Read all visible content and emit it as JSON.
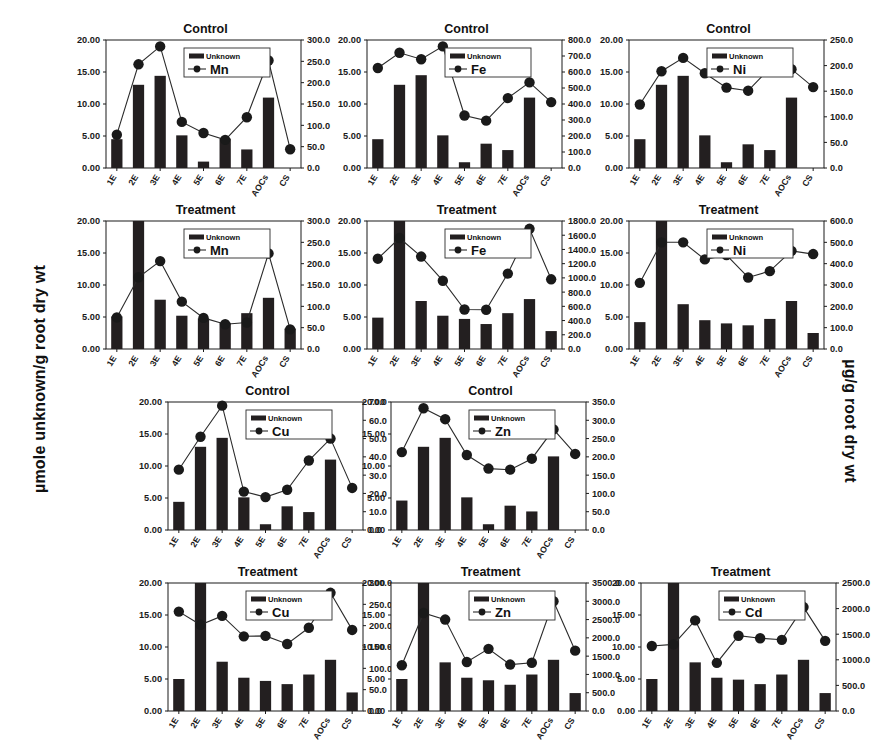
{
  "axes": {
    "left_label": "µmole unknown/g root dry wt",
    "right_label": "µg/g root dry wt"
  },
  "legend": {
    "bar_label": "Unknown"
  },
  "categories": [
    "1E",
    "2E",
    "3E",
    "4E",
    "5E",
    "6E",
    "7E",
    "AOCs",
    "CS"
  ],
  "left_axis_ticks": [
    "0.00",
    "5.00",
    "10.00",
    "15.00",
    "20.00"
  ],
  "chart_data": [
    {
      "id": "mn-control",
      "type": "bar",
      "title": "Control",
      "xlabel": "",
      "ylabel": "µmole unknown/g root dry wt",
      "y2label": "µg/g root dry wt",
      "categories": [
        "1E",
        "2E",
        "3E",
        "4E",
        "5E",
        "6E",
        "7E",
        "AOCs",
        "CS"
      ],
      "ylim": [
        0,
        20
      ],
      "y2lim": [
        0,
        300
      ],
      "right_axis_ticks": [
        "0.0",
        "50.0",
        "100.0",
        "150.0",
        "200.0",
        "250.0",
        "300.0"
      ],
      "grid": false,
      "legend_position": "top-center",
      "series": [
        {
          "name": "Unknown",
          "kind": "bar",
          "axis": "left",
          "values": [
            4.5,
            13.0,
            14.4,
            5.1,
            1.0,
            4.6,
            2.9,
            11.0,
            0.0
          ]
        },
        {
          "name": "Mn",
          "kind": "line",
          "axis": "right",
          "values": [
            78,
            243,
            285,
            108,
            82,
            66,
            119,
            252,
            44
          ]
        }
      ]
    },
    {
      "id": "fe-control",
      "type": "bar",
      "title": "Control",
      "xlabel": "",
      "ylabel": "µmole unknown/g root dry wt",
      "y2label": "µg/g root dry wt",
      "categories": [
        "1E",
        "2E",
        "3E",
        "4E",
        "5E",
        "6E",
        "7E",
        "AOCs",
        "CS"
      ],
      "ylim": [
        0,
        20
      ],
      "y2lim": [
        0,
        800
      ],
      "right_axis_ticks": [
        "0.0",
        "100.0",
        "200.0",
        "300.0",
        "400.0",
        "500.0",
        "600.0",
        "700.0",
        "800.0"
      ],
      "grid": false,
      "legend_position": "top-center",
      "series": [
        {
          "name": "Unknown",
          "kind": "bar",
          "axis": "left",
          "values": [
            4.5,
            13.0,
            14.5,
            5.1,
            0.9,
            3.8,
            2.8,
            11.0,
            0.0
          ]
        },
        {
          "name": "Fe",
          "kind": "line",
          "axis": "right",
          "values": [
            625,
            720,
            680,
            760,
            328,
            296,
            437,
            535,
            412
          ]
        }
      ]
    },
    {
      "id": "ni-control",
      "type": "bar",
      "title": "Control",
      "xlabel": "",
      "ylabel": "µmole unknown/g root dry wt",
      "y2label": "µg/g root dry wt",
      "categories": [
        "1E",
        "2E",
        "3E",
        "4E",
        "5E",
        "6E",
        "7E",
        "AOCs",
        "CS"
      ],
      "ylim": [
        0,
        20
      ],
      "y2lim": [
        0,
        250
      ],
      "right_axis_ticks": [
        "0.0",
        "50.0",
        "100.0",
        "150.0",
        "200.0",
        "250.0"
      ],
      "grid": false,
      "legend_position": "top-center",
      "series": [
        {
          "name": "Unknown",
          "kind": "bar",
          "axis": "left",
          "values": [
            4.5,
            13.0,
            14.4,
            5.1,
            0.9,
            3.7,
            2.8,
            11.0,
            0.0
          ]
        },
        {
          "name": "Ni",
          "kind": "line",
          "axis": "right",
          "values": [
            124,
            189,
            215,
            185,
            157,
            151,
            195,
            193,
            158
          ]
        }
      ]
    },
    {
      "id": "mn-treatment",
      "type": "bar",
      "title": "Treatment",
      "xlabel": "",
      "ylabel": "µmole unknown/g root dry wt",
      "y2label": "µg/g root dry wt",
      "categories": [
        "1E",
        "2E",
        "3E",
        "4E",
        "5E",
        "6E",
        "7E",
        "AOCs",
        "CS"
      ],
      "ylim": [
        0,
        20
      ],
      "y2lim": [
        0,
        300
      ],
      "right_axis_ticks": [
        "0.0",
        "50.0",
        "100.0",
        "150.0",
        "200.0",
        "250.0",
        "300.0"
      ],
      "grid": false,
      "legend_position": "top-center",
      "series": [
        {
          "name": "Unknown",
          "kind": "bar",
          "axis": "left",
          "values": [
            5.1,
            20.6,
            7.7,
            5.2,
            4.8,
            4.1,
            5.6,
            8.0,
            3.2
          ]
        },
        {
          "name": "Mn",
          "kind": "line",
          "axis": "right",
          "values": [
            74,
            168,
            206,
            111,
            73,
            58,
            62,
            224,
            46
          ]
        }
      ]
    },
    {
      "id": "fe-treatment",
      "type": "bar",
      "title": "Treatment",
      "xlabel": "",
      "ylabel": "µmole unknown/g root dry wt",
      "y2label": "µg/g root dry wt",
      "categories": [
        "1E",
        "2E",
        "3E",
        "4E",
        "5E",
        "6E",
        "7E",
        "AOCs",
        "CS"
      ],
      "ylim": [
        0,
        20
      ],
      "y2lim": [
        0,
        1800
      ],
      "right_axis_ticks": [
        "0.0",
        "200.0",
        "400.0",
        "600.0",
        "800.0",
        "1000.0",
        "1200.0",
        "1400.0",
        "1600.0",
        "1800.0"
      ],
      "grid": false,
      "legend_position": "top-center",
      "series": [
        {
          "name": "Unknown",
          "kind": "bar",
          "axis": "left",
          "values": [
            4.9,
            20.6,
            7.5,
            5.2,
            4.7,
            3.9,
            5.6,
            7.8,
            2.8
          ]
        },
        {
          "name": "Fe",
          "kind": "line",
          "axis": "right",
          "values": [
            1270,
            1560,
            1300,
            960,
            555,
            552,
            1060,
            1690,
            980
          ]
        }
      ]
    },
    {
      "id": "ni-treatment",
      "type": "bar",
      "title": "Treatment",
      "xlabel": "",
      "ylabel": "µmole unknown/g root dry wt",
      "y2label": "µg/g root dry wt",
      "categories": [
        "1E",
        "2E",
        "3E",
        "4E",
        "5E",
        "6E",
        "7E",
        "AOCs",
        "CS"
      ],
      "ylim": [
        0,
        20
      ],
      "y2lim": [
        0,
        600
      ],
      "right_axis_ticks": [
        "0.0",
        "100.0",
        "200.0",
        "300.0",
        "400.0",
        "500.0",
        "600.0"
      ],
      "grid": false,
      "legend_position": "top-center",
      "series": [
        {
          "name": "Unknown",
          "kind": "bar",
          "axis": "left",
          "values": [
            4.2,
            20.6,
            7.0,
            4.5,
            4.0,
            3.7,
            4.7,
            7.5,
            2.5
          ]
        },
        {
          "name": "Ni",
          "kind": "line",
          "axis": "right",
          "values": [
            310,
            500,
            500,
            420,
            440,
            335,
            365,
            460,
            445
          ]
        }
      ]
    },
    {
      "id": "cu-control",
      "type": "bar",
      "title": "Control",
      "xlabel": "",
      "ylabel": "µmole unknown/g root dry wt",
      "y2label": "µg/g root dry wt",
      "categories": [
        "1E",
        "2E",
        "3E",
        "4E",
        "5E",
        "6E",
        "7E",
        "AOCs",
        "CS"
      ],
      "ylim": [
        0,
        20
      ],
      "y2lim": [
        0,
        70
      ],
      "right_axis_ticks": [
        "0.0",
        "10.0",
        "20.0",
        "30.0",
        "40.0",
        "50.0",
        "60.0",
        "70.0"
      ],
      "grid": false,
      "legend_position": "top-center",
      "series": [
        {
          "name": "Unknown",
          "kind": "bar",
          "axis": "left",
          "values": [
            4.4,
            13.0,
            14.4,
            5.1,
            0.9,
            3.7,
            2.8,
            11.0,
            0.0
          ]
        },
        {
          "name": "Cu",
          "kind": "line",
          "axis": "right",
          "values": [
            33,
            51,
            68,
            21,
            18,
            22,
            38,
            50,
            23
          ]
        }
      ]
    },
    {
      "id": "zn-control",
      "type": "bar",
      "title": "Control",
      "xlabel": "",
      "ylabel": "µmole unknown/g root dry wt",
      "y2label": "µg/g root dry wt",
      "categories": [
        "1E",
        "2E",
        "3E",
        "4E",
        "5E",
        "6E",
        "7E",
        "AOCs",
        "CS"
      ],
      "ylim": [
        0,
        20
      ],
      "y2lim": [
        0,
        350
      ],
      "right_axis_ticks": [
        "0.0",
        "50.0",
        "100.0",
        "150.0",
        "200.0",
        "250.0",
        "300.0",
        "350.0"
      ],
      "grid": false,
      "legend_position": "top-center",
      "series": [
        {
          "name": "Unknown",
          "kind": "bar",
          "axis": "left",
          "values": [
            4.6,
            13.0,
            14.4,
            5.1,
            0.9,
            3.8,
            2.9,
            11.5,
            0.0
          ]
        },
        {
          "name": "Zn",
          "kind": "line",
          "axis": "right",
          "values": [
            213,
            333,
            303,
            205,
            168,
            165,
            195,
            275,
            208
          ]
        }
      ]
    },
    {
      "id": "cu-treatment",
      "type": "bar",
      "title": "Treatment",
      "xlabel": "",
      "ylabel": "µmole unknown/g root dry wt",
      "y2label": "µg/g root dry wt",
      "categories": [
        "1E",
        "2E",
        "3E",
        "4E",
        "5E",
        "6E",
        "7E",
        "AOCs",
        "CS"
      ],
      "ylim": [
        0,
        20
      ],
      "y2lim": [
        0,
        300
      ],
      "right_axis_ticks": [
        "0.0",
        "50.0",
        "100.0",
        "150.0",
        "200.0",
        "250.0",
        "300.0"
      ],
      "grid": false,
      "legend_position": "top-center",
      "series": [
        {
          "name": "Unknown",
          "kind": "bar",
          "axis": "left",
          "values": [
            5.0,
            20.6,
            7.7,
            5.2,
            4.7,
            4.2,
            5.7,
            8.0,
            2.9
          ]
        },
        {
          "name": "Cu",
          "kind": "line",
          "axis": "right",
          "values": [
            233,
            202,
            223,
            175,
            176,
            157,
            195,
            277,
            190
          ]
        }
      ]
    },
    {
      "id": "zn-treatment",
      "type": "bar",
      "title": "Treatment",
      "xlabel": "",
      "ylabel": "µmole unknown/g root dry wt",
      "y2label": "µg/g root dry wt",
      "categories": [
        "1E",
        "2E",
        "3E",
        "4E",
        "5E",
        "6E",
        "7E",
        "AOCs",
        "CS"
      ],
      "ylim": [
        0,
        20
      ],
      "y2lim": [
        0,
        3500
      ],
      "right_axis_ticks": [
        "0.0",
        "500.0",
        "1000.0",
        "1500.0",
        "2000.0",
        "2500.0",
        "3000.0",
        "3500.0"
      ],
      "grid": false,
      "legend_position": "top-center",
      "series": [
        {
          "name": "Unknown",
          "kind": "bar",
          "axis": "left",
          "values": [
            5.0,
            20.6,
            7.6,
            5.2,
            4.8,
            4.1,
            5.7,
            8.0,
            2.8
          ]
        },
        {
          "name": "Zn",
          "kind": "line",
          "axis": "right",
          "values": [
            1250,
            2680,
            2500,
            1340,
            1700,
            1270,
            1320,
            3000,
            1650
          ]
        }
      ]
    },
    {
      "id": "cd-treatment",
      "type": "bar",
      "title": "Treatment",
      "xlabel": "",
      "ylabel": "µmole unknown/g root dry wt",
      "y2label": "µg/g root dry wt",
      "categories": [
        "1E",
        "2E",
        "3E",
        "4E",
        "5E",
        "6E",
        "7E",
        "AOCs",
        "CS"
      ],
      "ylim": [
        0,
        20
      ],
      "y2lim": [
        0,
        2500
      ],
      "right_axis_ticks": [
        "0.0",
        "500.0",
        "1000.0",
        "1500.0",
        "2000.0",
        "2500.0"
      ],
      "grid": false,
      "legend_position": "top-center",
      "series": [
        {
          "name": "Unknown",
          "kind": "bar",
          "axis": "left",
          "values": [
            5.0,
            20.6,
            7.6,
            5.2,
            4.9,
            4.2,
            5.7,
            8.0,
            2.8
          ]
        },
        {
          "name": "Cd",
          "kind": "line",
          "axis": "right",
          "values": [
            1270,
            1300,
            1770,
            940,
            1470,
            1420,
            1390,
            2030,
            1370
          ]
        }
      ]
    }
  ],
  "panel_positions": [
    {
      "id": "mn-control",
      "left": 66,
      "top": 22
    },
    {
      "id": "fe-control",
      "left": 327,
      "top": 22
    },
    {
      "id": "ni-control",
      "left": 589,
      "top": 22
    },
    {
      "id": "mn-treatment",
      "left": 66,
      "top": 203
    },
    {
      "id": "fe-treatment",
      "left": 327,
      "top": 203
    },
    {
      "id": "ni-treatment",
      "left": 589,
      "top": 203
    },
    {
      "id": "cu-control",
      "left": 128,
      "top": 384
    },
    {
      "id": "zn-control",
      "left": 351,
      "top": 384
    },
    {
      "id": "cu-treatment",
      "left": 128,
      "top": 565
    },
    {
      "id": "zn-treatment",
      "left": 351,
      "top": 565
    },
    {
      "id": "cd-treatment",
      "left": 601,
      "top": 565
    }
  ]
}
